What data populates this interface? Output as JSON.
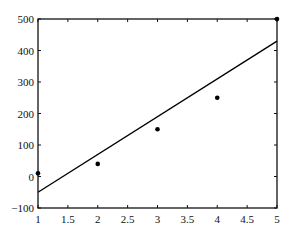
{
  "chart_data": {
    "type": "scatter",
    "title": "",
    "xlabel": "",
    "ylabel": "",
    "xlim": [
      1,
      5
    ],
    "ylim": [
      -100,
      500
    ],
    "grid": false,
    "legend": null,
    "x_ticks": [
      1,
      1.5,
      2,
      2.5,
      3,
      3.5,
      4,
      4.5,
      5
    ],
    "x_tick_labels": [
      "1",
      "1.5",
      "2",
      "2.5",
      "3",
      "3.5",
      "4",
      "4.5",
      "5"
    ],
    "y_ticks": [
      -100,
      0,
      100,
      200,
      300,
      400,
      500
    ],
    "y_tick_labels": [
      "−100",
      "0",
      "100",
      "200",
      "300",
      "400",
      "500"
    ],
    "series": [
      {
        "name": "data points",
        "type": "scatter",
        "x": [
          1,
          2,
          3,
          4,
          5
        ],
        "y": [
          10,
          40,
          150,
          250,
          500
        ],
        "color": "#000000"
      },
      {
        "name": "fitted line",
        "type": "line",
        "x": [
          1,
          5
        ],
        "y": [
          -50,
          430
        ],
        "color": "#000000"
      }
    ]
  }
}
